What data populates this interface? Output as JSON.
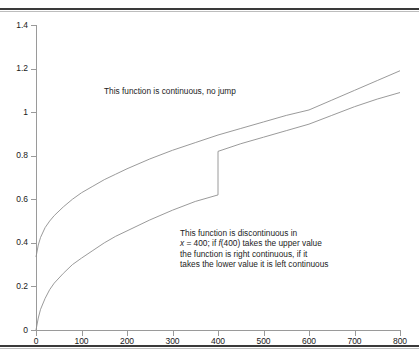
{
  "figure": {
    "background": "#ffffff",
    "axis_color": "#9a9a9a",
    "curve_color": "#8f8f8f",
    "rule_color": "#3a3a3a"
  },
  "annotations": {
    "top": "This function is continuous, no jump",
    "bottom_lines": [
      "This function is discontinuous in",
      "x = 400; if f(400) takes the upper value",
      "the function is right continuous, if it",
      "takes the lower value it is left continuous"
    ],
    "bottom_line2_prefix": "x",
    "bottom_line2_mid": " = 400; if ",
    "bottom_line2_f": "f",
    "bottom_line2_suffix": "(400) takes the upper value"
  },
  "chart_data": {
    "type": "line",
    "title": "",
    "xlabel": "",
    "ylabel": "",
    "xlim": [
      0,
      800
    ],
    "ylim": [
      0,
      1.4
    ],
    "xticks": [
      0,
      100,
      200,
      300,
      400,
      500,
      600,
      700,
      800
    ],
    "xticklabels": [
      "0",
      "100",
      "200",
      "300",
      "400",
      "500",
      "600",
      "700",
      "800"
    ],
    "yticks": [
      0,
      0.2,
      0.4,
      0.6,
      0.8,
      1,
      1.2,
      1.4
    ],
    "yticklabels": [
      "0",
      "0.2",
      "0.4",
      "0.6",
      "0.8",
      "1",
      "1.2",
      "1.4"
    ],
    "grid": false,
    "legend": false,
    "series": [
      {
        "name": "continuous function",
        "continuous": true,
        "x": [
          0,
          5,
          10,
          20,
          30,
          40,
          60,
          80,
          100,
          125,
          150,
          175,
          200,
          250,
          300,
          350,
          400,
          450,
          500,
          550,
          600,
          650,
          700,
          750,
          800
        ],
        "y": [
          0.335,
          0.39,
          0.425,
          0.47,
          0.5,
          0.525,
          0.565,
          0.6,
          0.63,
          0.66,
          0.69,
          0.715,
          0.74,
          0.785,
          0.825,
          0.86,
          0.895,
          0.925,
          0.955,
          0.985,
          1.01,
          1.055,
          1.1,
          1.145,
          1.19
        ]
      },
      {
        "name": "discontinuous function",
        "continuous": false,
        "jump_x": 400,
        "jump_from": 0.62,
        "jump_to": 0.82,
        "x": [
          0,
          5,
          10,
          20,
          30,
          40,
          60,
          80,
          100,
          125,
          150,
          175,
          200,
          250,
          300,
          350,
          400,
          400,
          450,
          500,
          550,
          600,
          650,
          700,
          750,
          800
        ],
        "y": [
          0.0,
          0.055,
          0.095,
          0.145,
          0.185,
          0.215,
          0.26,
          0.3,
          0.33,
          0.365,
          0.4,
          0.43,
          0.455,
          0.505,
          0.55,
          0.59,
          0.62,
          0.82,
          0.855,
          0.885,
          0.915,
          0.945,
          0.985,
          1.025,
          1.06,
          1.09
        ]
      }
    ]
  }
}
